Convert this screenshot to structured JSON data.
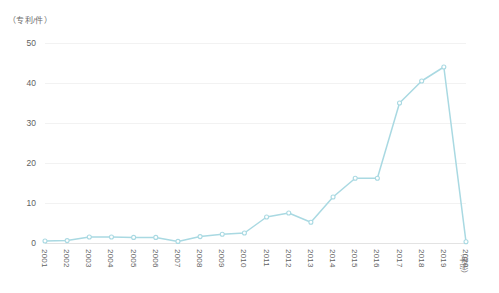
{
  "chart_data": {
    "type": "line",
    "title": "",
    "subtitle": "",
    "ylabel": "（专利/件）",
    "xlabel": "（年份）",
    "categories": [
      "2001",
      "2002",
      "2003",
      "2004",
      "2005",
      "2006",
      "2007",
      "2008",
      "2009",
      "2010",
      "2011",
      "2012",
      "2013",
      "2014",
      "2015",
      "2016",
      "2017",
      "2018",
      "2019",
      "2020"
    ],
    "values": [
      0.5,
      0.6,
      1.5,
      1.5,
      1.4,
      1.4,
      0.4,
      1.6,
      2.2,
      2.5,
      6.5,
      7.5,
      5.2,
      11.5,
      16.2,
      16.2,
      35.0,
      40.5,
      44.0,
      0.3
    ],
    "series": [
      {
        "name": "专利数量",
        "values": [
          0.5,
          0.6,
          1.5,
          1.5,
          1.4,
          1.4,
          0.4,
          1.6,
          2.2,
          2.5,
          6.5,
          7.5,
          5.2,
          11.5,
          16.2,
          16.2,
          35.0,
          40.5,
          44.0,
          0.3
        ]
      }
    ],
    "yticks": [
      0,
      10,
      20,
      30,
      40,
      50
    ],
    "ytick_labels": [
      "0",
      "10",
      "20",
      "30",
      "40",
      "50"
    ],
    "ylim": [
      0,
      52
    ],
    "grid": true,
    "legend": "none",
    "line_color": "#a9d9e2",
    "marker": "circle-open",
    "marker_color": "#a9d9e2"
  }
}
